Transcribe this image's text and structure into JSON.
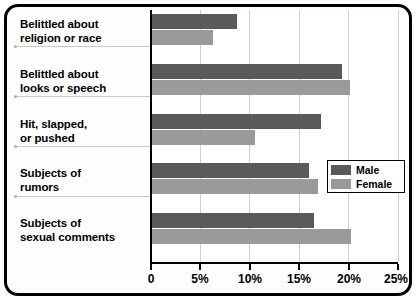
{
  "chart_data": {
    "type": "bar",
    "orientation": "horizontal",
    "title": "",
    "xlabel": "",
    "ylabel": "",
    "xlim": [
      0,
      25
    ],
    "xticks": [
      0,
      5,
      10,
      15,
      20,
      25
    ],
    "xtick_labels": [
      "0",
      "5%",
      "10%",
      "15%",
      "20%",
      "25%"
    ],
    "grid": true,
    "legend_position": "center-right",
    "categories": [
      "Belittled about religion or race",
      "Belittled about looks or speech",
      "Hit, slapped, or pushed",
      "Subjects of rumors",
      "Subjects of sexual comments"
    ],
    "category_lines": [
      [
        "Belittled about",
        "religion or race"
      ],
      [
        "Belittled about",
        "looks or speech"
      ],
      [
        "Hit, slapped,",
        "or pushed"
      ],
      [
        "Subjects of",
        "rumors"
      ],
      [
        "Subjects of",
        "sexual comments"
      ]
    ],
    "series": [
      {
        "name": "Male",
        "color": "#5a5a5a",
        "values": [
          8.8,
          19.4,
          17.2,
          16.0,
          16.5
        ]
      },
      {
        "name": "Female",
        "color": "#9a9a9a",
        "values": [
          6.3,
          20.2,
          10.6,
          16.9,
          20.3
        ]
      }
    ]
  },
  "legend": {
    "entries": [
      {
        "label": "Male",
        "color": "#5a5a5a"
      },
      {
        "label": "Female",
        "color": "#9a9a9a"
      }
    ]
  },
  "colors": {
    "male": "#5a5a5a",
    "female": "#9a9a9a",
    "frame": "#000000",
    "gridline": "#cfcfcf",
    "background": "#ffffff"
  }
}
